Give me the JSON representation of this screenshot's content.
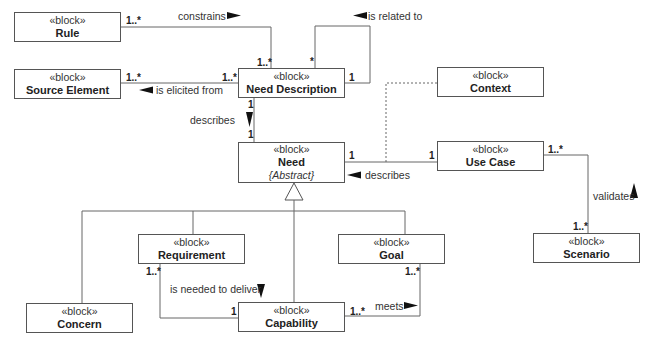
{
  "blocks": {
    "rule": {
      "stereotype": "«block»",
      "name": "Rule"
    },
    "source_element": {
      "stereotype": "«block»",
      "name": "Source Element"
    },
    "need_description": {
      "stereotype": "«block»",
      "name": "Need Description"
    },
    "context": {
      "stereotype": "«block»",
      "name": "Context"
    },
    "need": {
      "stereotype": "«block»",
      "name": "Need",
      "modifier": "{Abstract}"
    },
    "use_case": {
      "stereotype": "«block»",
      "name": "Use Case"
    },
    "scenario": {
      "stereotype": "«block»",
      "name": "Scenario"
    },
    "requirement": {
      "stereotype": "«block»",
      "name": "Requirement"
    },
    "goal": {
      "stereotype": "«block»",
      "name": "Goal"
    },
    "concern": {
      "stereotype": "«block»",
      "name": "Concern"
    },
    "capability": {
      "stereotype": "«block»",
      "name": "Capability"
    }
  },
  "associations": {
    "constrains": {
      "label": "constrains",
      "direction": "right",
      "mult_source": "1..*",
      "mult_target": "1..*"
    },
    "is_related_to": {
      "label": "is related to",
      "direction": "left",
      "mult_source": "*",
      "mult_target": "1"
    },
    "is_elicited_from": {
      "label": "is elicited from",
      "direction": "left",
      "mult_source": "1..*",
      "mult_target": "1..*"
    },
    "describes_need": {
      "label": "describes",
      "direction": "down",
      "mult_source": "1",
      "mult_target": "1"
    },
    "describes_use_case": {
      "label": "describes",
      "direction": "left",
      "mult_source": "1",
      "mult_target": "1"
    },
    "validates": {
      "label": "validates",
      "direction": "up",
      "mult_source": "1..*",
      "mult_target": "1..*"
    },
    "is_needed_to_deliver": {
      "label": "is needed to deliver",
      "direction": "down",
      "mult_source": "1..*",
      "mult_target": "1"
    },
    "meets": {
      "label": "meets",
      "direction": "right",
      "mult_source": "1..*",
      "mult_target": "1..*"
    }
  },
  "colors": {
    "line": "#666666",
    "border": "#555555",
    "text": "#222222",
    "arrow": "#111111"
  }
}
